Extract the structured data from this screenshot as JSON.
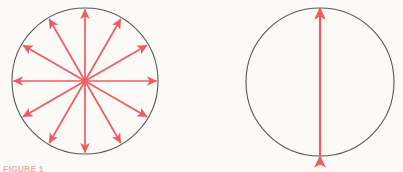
{
  "figure": {
    "caption": "FIGURE 1",
    "background_color": "#fbfaf7",
    "circle_stroke_color": "#58585a",
    "arrow_color": "#ef5b63",
    "panels": [
      {
        "name": "unpolarized-light",
        "circle": {
          "cx": 85,
          "cy": 81,
          "r": 73
        },
        "arrow_kind": "radial-double-headed",
        "arrow_count": 12,
        "angle_step_degrees": 30,
        "angles_degrees": [
          0,
          30,
          60,
          90,
          120,
          150,
          180,
          210,
          240,
          270,
          300,
          330
        ],
        "arrow_length_fraction": 0.98
      },
      {
        "name": "polarized-light",
        "circle": {
          "cx": 320,
          "cy": 82,
          "r": 74
        },
        "arrow_kind": "single-double-headed",
        "arrow_count": 1,
        "angle_step_degrees": 0,
        "angles_degrees": [
          90
        ],
        "arrow_length_fraction": 1.0
      }
    ]
  }
}
